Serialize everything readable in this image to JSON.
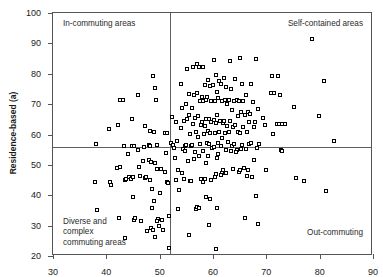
{
  "chart_data": {
    "type": "scatter",
    "title": "",
    "xlabel": "",
    "ylabel": "Residence-based (a)",
    "xlim": [
      30,
      90
    ],
    "ylim": [
      20,
      100
    ],
    "xticks": [
      30,
      40,
      50,
      60,
      70,
      80,
      90
    ],
    "yticks": [
      20,
      30,
      40,
      50,
      60,
      70,
      80,
      90,
      100
    ],
    "grid": false,
    "legend": "none",
    "marker": "open-square",
    "reference_lines": {
      "vertical_x": 52,
      "horizontal_y": 56
    },
    "quadrant_labels": {
      "top_left": "In-commuting areas",
      "top_right": "Self-contained areas",
      "bottom_left": "Diverse and\ncomplex\ncommuting areas",
      "bottom_right": "Out-commuting"
    },
    "points": [
      [
        38.2,
        56.6
      ],
      [
        38.0,
        44.3
      ],
      [
        38.4,
        35.0
      ],
      [
        40.5,
        61.6
      ],
      [
        40.8,
        44.2
      ],
      [
        41.0,
        43.1
      ],
      [
        42.3,
        62.8
      ],
      [
        42.6,
        71.2
      ],
      [
        43.2,
        71.3
      ],
      [
        42.1,
        48.9
      ],
      [
        42.6,
        49.3
      ],
      [
        42.4,
        32.4
      ],
      [
        43.4,
        55.9
      ],
      [
        43.6,
        44.9
      ],
      [
        43.8,
        45.3
      ],
      [
        43.5,
        25.6
      ],
      [
        44.2,
        53.5
      ],
      [
        44.4,
        46.0
      ],
      [
        44.7,
        45.3
      ],
      [
        44.9,
        55.9
      ],
      [
        45.2,
        56.1
      ],
      [
        45.0,
        45.8
      ],
      [
        45.1,
        39.4
      ],
      [
        45.3,
        31.6
      ],
      [
        45.5,
        32.3
      ],
      [
        44.9,
        64.9
      ],
      [
        46.0,
        54.6
      ],
      [
        46.2,
        49.0
      ],
      [
        46.4,
        46.2
      ],
      [
        46.1,
        72.8
      ],
      [
        46.5,
        31.3
      ],
      [
        47.2,
        55.6
      ],
      [
        47.0,
        51.2
      ],
      [
        47.4,
        45.5
      ],
      [
        47.6,
        45.9
      ],
      [
        47.3,
        62.5
      ],
      [
        47.8,
        28.1
      ],
      [
        48.1,
        56.5
      ],
      [
        48.3,
        56.2
      ],
      [
        48.0,
        51.6
      ],
      [
        48.4,
        50.7
      ],
      [
        48.2,
        45.0
      ],
      [
        48.6,
        35.6
      ],
      [
        48.5,
        28.9
      ],
      [
        48.8,
        28.5
      ],
      [
        48.3,
        61.1
      ],
      [
        48.7,
        42.0
      ],
      [
        48.9,
        79.2
      ],
      [
        49.2,
        75.1
      ],
      [
        49.4,
        71.1
      ],
      [
        49.1,
        60.8
      ],
      [
        49.5,
        56.3
      ],
      [
        49.3,
        50.3
      ],
      [
        49.6,
        48.5
      ],
      [
        49.0,
        37.8
      ],
      [
        49.8,
        32.1
      ],
      [
        49.5,
        31.4
      ],
      [
        49.9,
        29.8
      ],
      [
        49.2,
        26.0
      ],
      [
        50.3,
        48.4
      ],
      [
        50.1,
        40.7
      ],
      [
        50.5,
        31.8
      ],
      [
        50.8,
        28.3
      ],
      [
        51.2,
        53.7
      ],
      [
        51.0,
        47.6
      ],
      [
        51.4,
        44.2
      ],
      [
        51.6,
        43.9
      ],
      [
        51.1,
        60.2
      ],
      [
        51.5,
        60.4
      ],
      [
        51.8,
        33.0
      ],
      [
        51.9,
        22.4
      ],
      [
        52.4,
        65.5
      ],
      [
        52.2,
        57.2
      ],
      [
        52.6,
        56.5
      ],
      [
        52.8,
        55.4
      ],
      [
        53.1,
        63.9
      ],
      [
        53.4,
        57.6
      ],
      [
        53.0,
        52.0
      ],
      [
        53.6,
        48.2
      ],
      [
        53.2,
        44.9
      ],
      [
        53.8,
        41.5
      ],
      [
        53.5,
        35.4
      ],
      [
        54.0,
        76.4
      ],
      [
        54.3,
        68.5
      ],
      [
        54.6,
        64.4
      ],
      [
        54.1,
        62.0
      ],
      [
        54.8,
        56.1
      ],
      [
        54.4,
        55.2
      ],
      [
        54.9,
        54.3
      ],
      [
        54.2,
        47.2
      ],
      [
        54.7,
        45.1
      ],
      [
        55.2,
        81.3
      ],
      [
        55.5,
        73.2
      ],
      [
        55.0,
        69.9
      ],
      [
        55.6,
        66.1
      ],
      [
        55.3,
        64.8
      ],
      [
        55.8,
        60.1
      ],
      [
        55.1,
        56.5
      ],
      [
        55.9,
        56.2
      ],
      [
        55.4,
        51.2
      ],
      [
        55.7,
        44.6
      ],
      [
        55.5,
        26.8
      ],
      [
        56.3,
        82.1
      ],
      [
        56.6,
        73.0
      ],
      [
        56.1,
        68.6
      ],
      [
        56.8,
        65.4
      ],
      [
        56.4,
        63.2
      ],
      [
        56.9,
        60.6
      ],
      [
        56.2,
        56.4
      ],
      [
        56.7,
        54.1
      ],
      [
        56.5,
        51.9
      ],
      [
        56.0,
        44.4
      ],
      [
        56.9,
        35.4
      ],
      [
        57.1,
        83.2
      ],
      [
        57.4,
        81.9
      ],
      [
        57.0,
        73.4
      ],
      [
        57.6,
        70.9
      ],
      [
        57.3,
        66.0
      ],
      [
        57.8,
        62.9
      ],
      [
        57.2,
        58.9
      ],
      [
        57.7,
        56.7
      ],
      [
        57.5,
        52.6
      ],
      [
        57.9,
        45.3
      ],
      [
        57.1,
        36.1
      ],
      [
        57.4,
        35.8
      ],
      [
        58.2,
        82.2
      ],
      [
        58.5,
        76.2
      ],
      [
        58.0,
        72.3
      ],
      [
        58.7,
        71.2
      ],
      [
        58.3,
        70.9
      ],
      [
        58.8,
        65.1
      ],
      [
        58.1,
        63.9
      ],
      [
        58.6,
        62.6
      ],
      [
        58.4,
        59.9
      ],
      [
        58.9,
        57.1
      ],
      [
        58.2,
        54.3
      ],
      [
        58.7,
        50.6
      ],
      [
        58.5,
        45.1
      ],
      [
        58.3,
        44.2
      ],
      [
        58.8,
        39.3
      ],
      [
        59.2,
        77.8
      ],
      [
        59.5,
        75.9
      ],
      [
        59.0,
        72.1
      ],
      [
        59.7,
        70.7
      ],
      [
        59.3,
        64.9
      ],
      [
        59.8,
        63.8
      ],
      [
        59.1,
        60.9
      ],
      [
        59.6,
        60.3
      ],
      [
        59.4,
        56.6
      ],
      [
        59.9,
        55.4
      ],
      [
        59.2,
        52.7
      ],
      [
        59.7,
        44.8
      ],
      [
        59.5,
        38.7
      ],
      [
        59.3,
        30.1
      ],
      [
        60.3,
        84.3
      ],
      [
        60.6,
        79.4
      ],
      [
        60.1,
        76.1
      ],
      [
        60.8,
        73.8
      ],
      [
        60.4,
        71.0
      ],
      [
        60.9,
        66.3
      ],
      [
        60.2,
        64.6
      ],
      [
        60.7,
        63.7
      ],
      [
        60.5,
        60.2
      ],
      [
        61.0,
        56.9
      ],
      [
        60.3,
        55.8
      ],
      [
        60.8,
        52.1
      ],
      [
        60.6,
        46.9
      ],
      [
        60.4,
        45.7
      ],
      [
        60.9,
        35.5
      ],
      [
        60.7,
        22.3
      ],
      [
        61.3,
        77.4
      ],
      [
        61.6,
        76.5
      ],
      [
        61.1,
        72.0
      ],
      [
        61.8,
        70.8
      ],
      [
        61.4,
        64.2
      ],
      [
        61.9,
        63.5
      ],
      [
        61.2,
        60.7
      ],
      [
        61.7,
        58.6
      ],
      [
        61.5,
        56.2
      ],
      [
        61.0,
        53.4
      ],
      [
        61.8,
        47.3
      ],
      [
        61.6,
        46.6
      ],
      [
        62.2,
        78.3
      ],
      [
        62.5,
        75.6
      ],
      [
        62.4,
        71.3
      ],
      [
        62.8,
        69.9
      ],
      [
        62.1,
        64.4
      ],
      [
        62.7,
        62.7
      ],
      [
        62.3,
        60.4
      ],
      [
        62.9,
        57.4
      ],
      [
        62.6,
        54.6
      ],
      [
        62.0,
        48.3
      ],
      [
        62.5,
        47.0
      ],
      [
        63.2,
        84.1
      ],
      [
        63.5,
        74.7
      ],
      [
        63.0,
        71.1
      ],
      [
        63.7,
        67.9
      ],
      [
        63.3,
        64.2
      ],
      [
        63.8,
        62.3
      ],
      [
        63.1,
        60.5
      ],
      [
        63.6,
        56.1
      ],
      [
        63.4,
        54.5
      ],
      [
        63.9,
        48.6
      ],
      [
        64.2,
        78.1
      ],
      [
        64.5,
        71.3
      ],
      [
        64.0,
        70.9
      ],
      [
        64.7,
        65.9
      ],
      [
        64.3,
        63.1
      ],
      [
        64.8,
        60.6
      ],
      [
        64.1,
        56.6
      ],
      [
        64.6,
        54.7
      ],
      [
        64.4,
        54.1
      ],
      [
        64.9,
        47.6
      ],
      [
        65.2,
        85.0
      ],
      [
        65.5,
        76.4
      ],
      [
        65.0,
        71.0
      ],
      [
        65.7,
        70.8
      ],
      [
        65.3,
        67.2
      ],
      [
        65.8,
        62.3
      ],
      [
        65.1,
        60.3
      ],
      [
        65.6,
        56.3
      ],
      [
        65.4,
        55.0
      ],
      [
        65.9,
        48.7
      ],
      [
        65.2,
        48.1
      ],
      [
        66.3,
        72.9
      ],
      [
        66.6,
        67.1
      ],
      [
        66.1,
        66.4
      ],
      [
        66.8,
        63.8
      ],
      [
        66.4,
        60.6
      ],
      [
        66.9,
        56.7
      ],
      [
        66.2,
        55.0
      ],
      [
        66.7,
        48.3
      ],
      [
        66.5,
        46.2
      ],
      [
        66.1,
        32.4
      ],
      [
        67.2,
        76.3
      ],
      [
        67.5,
        70.6
      ],
      [
        67.0,
        66.5
      ],
      [
        67.7,
        62.2
      ],
      [
        67.3,
        57.2
      ],
      [
        67.8,
        51.6
      ],
      [
        67.4,
        45.9
      ],
      [
        68.2,
        84.8
      ],
      [
        68.5,
        68.2
      ],
      [
        68.0,
        63.9
      ],
      [
        68.7,
        56.8
      ],
      [
        68.3,
        55.4
      ],
      [
        68.1,
        39.7
      ],
      [
        68.6,
        30.3
      ],
      [
        69.4,
        65.2
      ],
      [
        69.8,
        62.8
      ],
      [
        70.1,
        48.0
      ],
      [
        71.2,
        79.2
      ],
      [
        71.6,
        73.6
      ],
      [
        71.0,
        73.5
      ],
      [
        71.4,
        60.0
      ],
      [
        72.2,
        79.0
      ],
      [
        72.6,
        72.7
      ],
      [
        72.0,
        63.2
      ],
      [
        72.4,
        63.3
      ],
      [
        72.8,
        54.7
      ],
      [
        73.1,
        63.2
      ],
      [
        73.5,
        63.4
      ],
      [
        73.0,
        54.5
      ],
      [
        75.3,
        68.8
      ],
      [
        75.6,
        45.5
      ],
      [
        77.2,
        44.5
      ],
      [
        78.6,
        91.3
      ],
      [
        80.0,
        66.0
      ],
      [
        80.9,
        77.3
      ],
      [
        81.2,
        41.3
      ],
      [
        82.8,
        57.6
      ]
    ]
  }
}
